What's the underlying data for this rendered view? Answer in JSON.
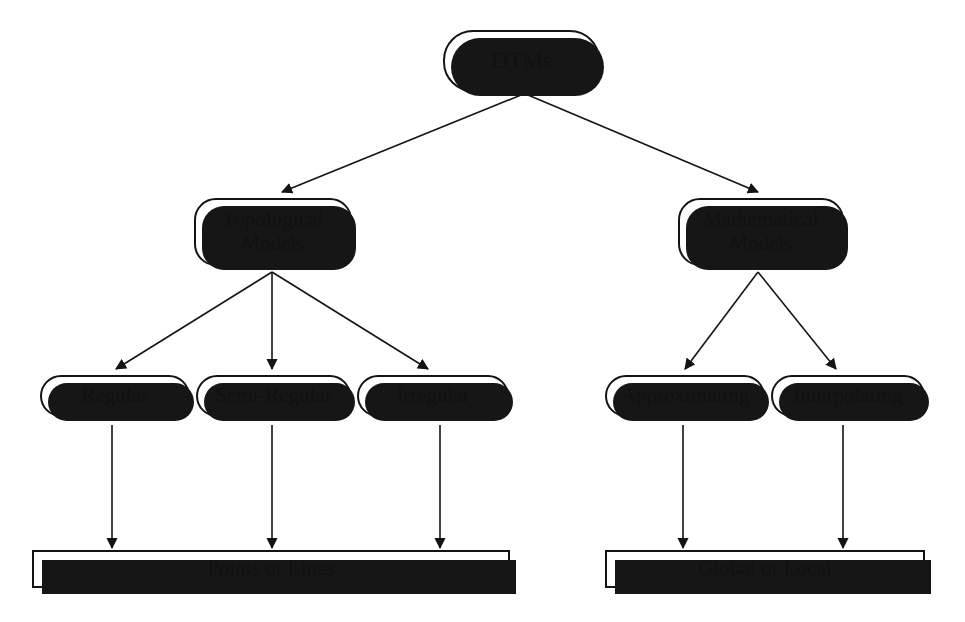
{
  "diagram": {
    "type": "hierarchy-tree",
    "background_color": "#ffffff",
    "line_color": "#141414",
    "shadow_color": "#161616",
    "nodes": {
      "root": {
        "label": "DTMs",
        "shape": "rounded"
      },
      "topological": {
        "label": "Topological\nModels",
        "shape": "rounded"
      },
      "mathematical": {
        "label": "Mathematical\nModels",
        "shape": "rounded"
      },
      "regular": {
        "label": "Regular",
        "shape": "rounded"
      },
      "semi_regular": {
        "label": "Semi-Regular",
        "shape": "rounded"
      },
      "irregular": {
        "label": "Irregular",
        "shape": "rounded"
      },
      "approximating": {
        "label": "Approximating",
        "shape": "rounded"
      },
      "interpolating": {
        "label": "Interpolating",
        "shape": "rounded"
      },
      "points_or_lines": {
        "label": "Points or Lines",
        "shape": "rectangle"
      },
      "global_or_local": {
        "label": "Global or Local",
        "shape": "rectangle"
      }
    },
    "edges": [
      {
        "from": "root",
        "to": "topological"
      },
      {
        "from": "root",
        "to": "mathematical"
      },
      {
        "from": "topological",
        "to": "regular"
      },
      {
        "from": "topological",
        "to": "semi_regular"
      },
      {
        "from": "topological",
        "to": "irregular"
      },
      {
        "from": "mathematical",
        "to": "approximating"
      },
      {
        "from": "mathematical",
        "to": "interpolating"
      },
      {
        "from": "regular",
        "to": "points_or_lines"
      },
      {
        "from": "semi_regular",
        "to": "points_or_lines"
      },
      {
        "from": "irregular",
        "to": "points_or_lines"
      },
      {
        "from": "approximating",
        "to": "global_or_local"
      },
      {
        "from": "interpolating",
        "to": "global_or_local"
      }
    ]
  }
}
